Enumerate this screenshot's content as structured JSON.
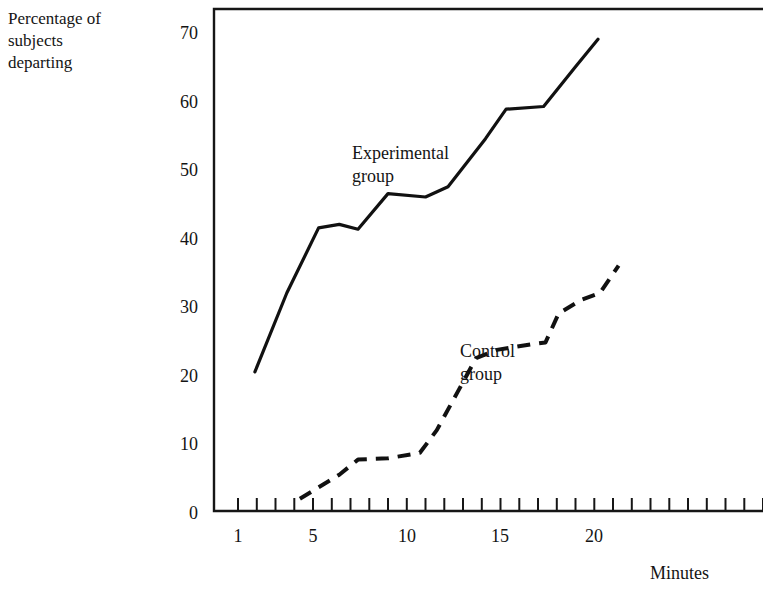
{
  "chart_data": {
    "type": "line",
    "title": "",
    "subtitle": "",
    "xlabel": "Minutes",
    "ylabel": "Percentage of subjects departing",
    "ylabel_lines": [
      "Percentage of",
      "subjects",
      "departing"
    ],
    "xlim": [
      0,
      21.8
    ],
    "ylim": [
      0,
      73
    ],
    "grid": false,
    "legend": "inline annotations",
    "yticks": [
      0,
      10,
      20,
      30,
      40,
      50,
      60,
      70
    ],
    "ytick_labels": [
      "0",
      "10",
      "20",
      "30",
      "40",
      "50",
      "60",
      "70"
    ],
    "xticks": [
      1,
      2,
      3,
      4,
      5,
      6,
      7,
      8,
      9,
      10,
      11,
      12,
      13,
      14,
      15,
      16,
      17,
      18,
      19,
      20,
      21
    ],
    "xtick_labels_shown": [
      "1",
      "5",
      "10",
      "15",
      "20"
    ],
    "xtick_labels_shown_at": [
      1,
      5,
      10,
      15,
      20
    ],
    "series": [
      {
        "name": "Experimental group",
        "style": "solid",
        "color": "#111111",
        "annotation_lines": [
          "Experimental",
          "group"
        ],
        "x": [
          1.9,
          3.6,
          5.3,
          6.4,
          7.4,
          9.0,
          11.0,
          12.2,
          14.2,
          15.3,
          17.3,
          19.0,
          20.2
        ],
        "y": [
          20.0,
          31.5,
          41.0,
          41.5,
          40.8,
          46.0,
          45.5,
          47.0,
          54.0,
          58.3,
          58.7,
          64.5,
          68.5
        ]
      },
      {
        "name": "Control group",
        "style": "dashed",
        "color": "#111111",
        "annotation_lines": [
          "Control",
          "group"
        ],
        "x": [
          4.3,
          6.4,
          7.4,
          9.0,
          10.7,
          11.6,
          12.7,
          13.7,
          14.8,
          16.6,
          17.4,
          18.1,
          19.3,
          20.3,
          21.3
        ],
        "y": [
          1.5,
          5.0,
          7.2,
          7.4,
          8.2,
          11.5,
          17.0,
          22.0,
          23.2,
          24.0,
          24.3,
          28.5,
          30.5,
          31.5,
          35.5
        ]
      }
    ]
  },
  "axis_title_x": "Minutes"
}
